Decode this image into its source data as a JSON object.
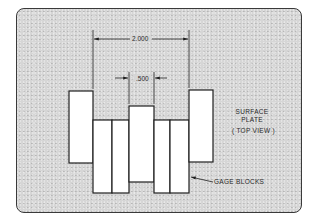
{
  "diagram": {
    "dimensions": {
      "outer": "2.000",
      "inner": ".500"
    },
    "labels": {
      "surface_plate_line1": "SURFACE",
      "surface_plate_line2": "PLATE",
      "view": "( TOP VIEW )",
      "gage_blocks": "GAGE BLOCKS"
    },
    "colors": {
      "plate": "#d6d6d6",
      "block_fill": "#ffffff",
      "line": "#1e1e1e"
    },
    "blocks": [
      {
        "name": "left-outer-block",
        "x": 69,
        "y": 91,
        "w": 24,
        "h": 72
      },
      {
        "name": "left-block-2",
        "x": 93,
        "y": 120,
        "w": 19,
        "h": 73
      },
      {
        "name": "left-block-3",
        "x": 112,
        "y": 120,
        "w": 17,
        "h": 73
      },
      {
        "name": "center-block",
        "x": 129,
        "y": 106,
        "w": 25,
        "h": 76
      },
      {
        "name": "right-block-3",
        "x": 154,
        "y": 120,
        "w": 16,
        "h": 73
      },
      {
        "name": "right-block-2",
        "x": 170,
        "y": 120,
        "w": 19,
        "h": 73
      },
      {
        "name": "right-outer-block",
        "x": 189,
        "y": 90,
        "w": 24,
        "h": 72
      }
    ]
  }
}
